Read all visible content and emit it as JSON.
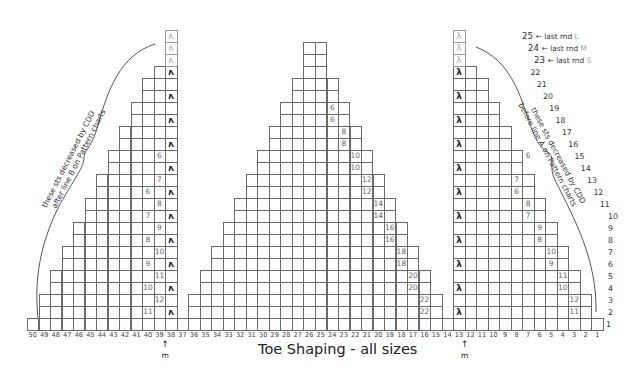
{
  "title": "Toe Shaping - all sizes",
  "marker_label": "m",
  "markers": [
    {
      "col": 38.5,
      "label": "m"
    },
    {
      "col": 12.5,
      "label": "m"
    }
  ],
  "notes": {
    "left": [
      "these sts decreased by CDD",
      "after line B on Pattern charts"
    ],
    "right": [
      "these sts decreased by CDD",
      "before line A on Pattern charts"
    ]
  },
  "last_rounds": [
    {
      "row": 25,
      "text": "last rnd",
      "size": "L"
    },
    {
      "row": 24,
      "text": "last rnd",
      "size": "M"
    },
    {
      "row": 23,
      "text": "last rnd",
      "size": "S"
    }
  ],
  "columns": [
    50,
    49,
    48,
    47,
    46,
    45,
    44,
    43,
    42,
    41,
    40,
    39,
    38,
    37,
    36,
    35,
    34,
    33,
    32,
    31,
    30,
    29,
    28,
    27,
    26,
    25,
    24,
    23,
    22,
    21,
    20,
    19,
    18,
    17,
    16,
    15,
    14,
    13,
    12,
    11,
    10,
    9,
    8,
    7,
    6,
    5,
    4,
    3,
    2,
    1
  ],
  "rows": [
    1,
    2,
    3,
    4,
    5,
    6,
    7,
    8,
    9,
    10,
    11,
    12,
    13,
    14,
    15,
    16,
    17,
    18,
    19,
    20,
    21,
    22,
    23,
    24,
    25
  ],
  "legend": {
    "cdd_left_symbol": "left-leaning-decrease",
    "cdd_right_symbol": "right-leaning-decrease"
  },
  "chart_data": {
    "type": "table",
    "title": "Toe Shaping - all sizes",
    "xlabel": "stitch (columns 50 → 1)",
    "ylabel": "round (rows 1 → 25)",
    "total_columns": 50,
    "total_rows": 25,
    "sections": [
      {
        "name": "left",
        "decrease_column": 38,
        "decrease_rows": [
          2,
          4,
          6,
          8,
          10,
          12,
          14,
          16,
          18,
          20,
          22,
          23,
          24,
          25
        ],
        "row_spans": {
          "1": [
            37,
            50
          ],
          "2": [
            38,
            49
          ],
          "3": [
            38,
            49
          ],
          "4": [
            38,
            48
          ],
          "5": [
            38,
            48
          ],
          "6": [
            38,
            47
          ],
          "7": [
            38,
            47
          ],
          "8": [
            38,
            46
          ],
          "9": [
            38,
            46
          ],
          "10": [
            38,
            45
          ],
          "11": [
            38,
            45
          ],
          "12": [
            38,
            44
          ],
          "13": [
            38,
            44
          ],
          "14": [
            38,
            43
          ],
          "15": [
            38,
            43
          ],
          "16": [
            38,
            42
          ],
          "17": [
            38,
            42
          ],
          "18": [
            38,
            41
          ],
          "19": [
            38,
            41
          ],
          "20": [
            38,
            40
          ],
          "21": [
            38,
            40
          ],
          "22": [
            38,
            39
          ],
          "23": [
            38,
            38
          ],
          "24": [
            38,
            38
          ],
          "25": [
            38,
            38
          ]
        },
        "count_labels": [
          {
            "row": 2,
            "col": 40,
            "value": 11
          },
          {
            "row": 3,
            "col": 39,
            "value": 12
          },
          {
            "row": 4,
            "col": 40,
            "value": 10
          },
          {
            "row": 5,
            "col": 39,
            "value": 11
          },
          {
            "row": 6,
            "col": 40,
            "value": 9
          },
          {
            "row": 7,
            "col": 39,
            "value": 10
          },
          {
            "row": 8,
            "col": 40,
            "value": 8
          },
          {
            "row": 9,
            "col": 39,
            "value": 9
          },
          {
            "row": 10,
            "col": 40,
            "value": 7
          },
          {
            "row": 11,
            "col": 39,
            "value": 8
          },
          {
            "row": 12,
            "col": 40,
            "value": 6
          },
          {
            "row": 13,
            "col": 39,
            "value": 7
          },
          {
            "row": 15,
            "col": 39,
            "value": 6
          }
        ]
      },
      {
        "name": "middle",
        "row_spans": {
          "1": [
            14,
            36
          ],
          "2": [
            15,
            36
          ],
          "3": [
            15,
            36
          ],
          "4": [
            16,
            35
          ],
          "5": [
            16,
            35
          ],
          "6": [
            17,
            34
          ],
          "7": [
            17,
            34
          ],
          "8": [
            18,
            33
          ],
          "9": [
            18,
            33
          ],
          "10": [
            19,
            32
          ],
          "11": [
            19,
            32
          ],
          "12": [
            20,
            31
          ],
          "13": [
            20,
            31
          ],
          "14": [
            21,
            30
          ],
          "15": [
            21,
            30
          ],
          "16": [
            22,
            29
          ],
          "17": [
            22,
            29
          ],
          "18": [
            23,
            28
          ],
          "19": [
            23,
            28
          ],
          "20": [
            24,
            27
          ],
          "21": [
            24,
            27
          ],
          "22": [
            25,
            26
          ],
          "23": [
            25,
            26
          ],
          "24": [
            25,
            26
          ]
        },
        "count_labels": [
          {
            "row": 2,
            "col": 16,
            "value": 22
          },
          {
            "row": 3,
            "col": 16,
            "value": 22
          },
          {
            "row": 4,
            "col": 17,
            "value": 20
          },
          {
            "row": 5,
            "col": 17,
            "value": 20
          },
          {
            "row": 6,
            "col": 18,
            "value": 18
          },
          {
            "row": 7,
            "col": 18,
            "value": 18
          },
          {
            "row": 8,
            "col": 19,
            "value": 16
          },
          {
            "row": 9,
            "col": 19,
            "value": 16
          },
          {
            "row": 10,
            "col": 20,
            "value": 14
          },
          {
            "row": 11,
            "col": 20,
            "value": 14
          },
          {
            "row": 12,
            "col": 21,
            "value": 12
          },
          {
            "row": 13,
            "col": 21,
            "value": 12
          },
          {
            "row": 14,
            "col": 22,
            "value": 10
          },
          {
            "row": 15,
            "col": 22,
            "value": 10
          },
          {
            "row": 16,
            "col": 23,
            "value": 8
          },
          {
            "row": 17,
            "col": 23,
            "value": 8
          },
          {
            "row": 18,
            "col": 24,
            "value": 6
          },
          {
            "row": 19,
            "col": 24,
            "value": 6
          }
        ]
      },
      {
        "name": "right",
        "decrease_column": 13,
        "decrease_rows": [
          2,
          4,
          6,
          8,
          10,
          12,
          14,
          16,
          18,
          20,
          22,
          23,
          24,
          25
        ],
        "row_spans": {
          "1": [
            1,
            13
          ],
          "2": [
            2,
            13
          ],
          "3": [
            2,
            13
          ],
          "4": [
            3,
            13
          ],
          "5": [
            3,
            13
          ],
          "6": [
            4,
            13
          ],
          "7": [
            4,
            13
          ],
          "8": [
            5,
            13
          ],
          "9": [
            5,
            13
          ],
          "10": [
            6,
            13
          ],
          "11": [
            6,
            13
          ],
          "12": [
            7,
            13
          ],
          "13": [
            7,
            13
          ],
          "14": [
            8,
            13
          ],
          "15": [
            8,
            13
          ],
          "16": [
            9,
            13
          ],
          "17": [
            9,
            13
          ],
          "18": [
            10,
            13
          ],
          "19": [
            10,
            13
          ],
          "20": [
            11,
            13
          ],
          "21": [
            11,
            13
          ],
          "22": [
            12,
            13
          ],
          "23": [
            13,
            13
          ],
          "24": [
            13,
            13
          ],
          "25": [
            13,
            13
          ]
        },
        "count_labels": [
          {
            "row": 2,
            "col": 3,
            "value": 11
          },
          {
            "row": 3,
            "col": 3,
            "value": 12
          },
          {
            "row": 4,
            "col": 4,
            "value": 10
          },
          {
            "row": 5,
            "col": 4,
            "value": 11
          },
          {
            "row": 6,
            "col": 5,
            "value": 9
          },
          {
            "row": 7,
            "col": 5,
            "value": 10
          },
          {
            "row": 8,
            "col": 6,
            "value": 8
          },
          {
            "row": 9,
            "col": 6,
            "value": 9
          },
          {
            "row": 10,
            "col": 7,
            "value": 7
          },
          {
            "row": 11,
            "col": 7,
            "value": 8
          },
          {
            "row": 12,
            "col": 8,
            "value": 6
          },
          {
            "row": 13,
            "col": 8,
            "value": 7
          },
          {
            "row": 15,
            "col": 7,
            "value": 6
          }
        ]
      }
    ]
  }
}
